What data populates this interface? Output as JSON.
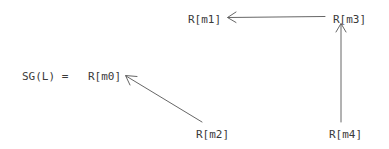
{
  "diagram": {
    "title_expression": "SG(L) =",
    "background_color": "#ffffff",
    "stroke_color": "#555555",
    "text_color": "#3a3a3a",
    "nodes": [
      {
        "id": "m0",
        "label": "R[m0]",
        "x": 88,
        "y": 70
      },
      {
        "id": "m1",
        "label": "R[m1]",
        "x": 188,
        "y": 13
      },
      {
        "id": "m2",
        "label": "R[m2]",
        "x": 196,
        "y": 128
      },
      {
        "id": "m3",
        "label": "R[m3]",
        "x": 333,
        "y": 13
      },
      {
        "id": "m4",
        "label": "R[m4]",
        "x": 329,
        "y": 128
      }
    ],
    "edges": [
      {
        "from": "m3",
        "to": "m1",
        "direction": "left",
        "x1": 325,
        "y1": 16,
        "x2": 228,
        "y2": 17
      },
      {
        "from": "m4",
        "to": "m3",
        "direction": "up",
        "x1": 341,
        "y1": 122,
        "x2": 341,
        "y2": 24
      },
      {
        "from": "m2",
        "to": "m0",
        "direction": "up-left",
        "x1": 202,
        "y1": 122,
        "x2": 126,
        "y2": 76
      }
    ]
  }
}
